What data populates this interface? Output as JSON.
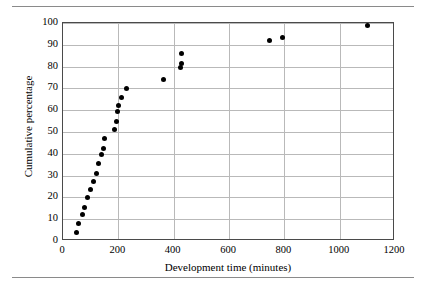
{
  "chart_data": {
    "type": "scatter",
    "title": "",
    "xlabel": "Development time (minutes)",
    "ylabel": "Cumulative percentage",
    "xlim": [
      0,
      1200
    ],
    "ylim": [
      0,
      100
    ],
    "xticks": [
      0,
      200,
      400,
      600,
      800,
      1000,
      1200
    ],
    "yticks": [
      0,
      10,
      20,
      30,
      40,
      50,
      60,
      70,
      80,
      90,
      100
    ],
    "grid": "horizontal-and-vertical",
    "legend": "none",
    "marker": "filled-circle",
    "marker_color": "#000000",
    "x": [
      50,
      55,
      70,
      78,
      90,
      100,
      110,
      120,
      130,
      140,
      145,
      150,
      185,
      192,
      196,
      200,
      212,
      230,
      365,
      425,
      428,
      428,
      745,
      795,
      1100
    ],
    "y": [
      4,
      8,
      12,
      15.5,
      19.8,
      23.5,
      27.5,
      31,
      35.5,
      39.8,
      42.5,
      47,
      51,
      55,
      59.5,
      62,
      66,
      70,
      74,
      79.5,
      81.5,
      86,
      92,
      93.5,
      99
    ],
    "points": [
      {
        "x": 50,
        "y": 4
      },
      {
        "x": 55,
        "y": 8
      },
      {
        "x": 70,
        "y": 12
      },
      {
        "x": 78,
        "y": 15.5
      },
      {
        "x": 90,
        "y": 19.8
      },
      {
        "x": 100,
        "y": 23.5
      },
      {
        "x": 110,
        "y": 27.5
      },
      {
        "x": 120,
        "y": 31
      },
      {
        "x": 130,
        "y": 35.5
      },
      {
        "x": 140,
        "y": 39.8
      },
      {
        "x": 145,
        "y": 42.5
      },
      {
        "x": 150,
        "y": 47
      },
      {
        "x": 185,
        "y": 51
      },
      {
        "x": 192,
        "y": 55
      },
      {
        "x": 196,
        "y": 59.5
      },
      {
        "x": 200,
        "y": 62
      },
      {
        "x": 212,
        "y": 66
      },
      {
        "x": 230,
        "y": 70
      },
      {
        "x": 365,
        "y": 74
      },
      {
        "x": 425,
        "y": 79.5
      },
      {
        "x": 428,
        "y": 81.5
      },
      {
        "x": 428,
        "y": 86
      },
      {
        "x": 745,
        "y": 92
      },
      {
        "x": 795,
        "y": 93.5
      },
      {
        "x": 1100,
        "y": 99
      }
    ]
  },
  "axis": {
    "x_tick_labels": [
      "0",
      "200",
      "400",
      "600",
      "800",
      "1000",
      "1200"
    ],
    "y_tick_labels": [
      "0",
      "10",
      "20",
      "30",
      "40",
      "50",
      "60",
      "70",
      "80",
      "90",
      "100"
    ]
  }
}
